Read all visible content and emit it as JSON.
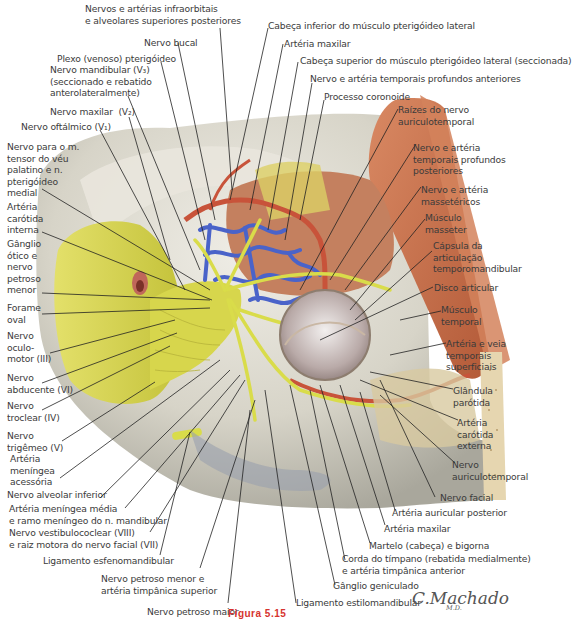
{
  "figure": {
    "figure_label": "Figura 5.15",
    "signature": "C.Machado",
    "signature_sub": "M.D."
  },
  "labels": {
    "top": [
      {
        "id": "infraorbitais",
        "text": "Nervos e artérias infraorbitais\ne alveolares superiores posteriores"
      },
      {
        "id": "bucal",
        "text": "Nervo bucal"
      },
      {
        "id": "plexo",
        "text": "Plexo (venoso) pterigóideo"
      },
      {
        "id": "mandibular",
        "text": "Nervo mandibular (V₃)\n(seccionado e rebatido\nanterolateralmente)"
      },
      {
        "id": "maxilar-n",
        "text": "Nervo maxilar  (V₂)"
      },
      {
        "id": "oftalmico",
        "text": "Nervo oftálmico (V₁)"
      },
      {
        "id": "cab-inf",
        "text": "Cabeça inferior do músculo pterigóideo lateral"
      },
      {
        "id": "art-maxilar-top",
        "text": "Artéria maxilar"
      },
      {
        "id": "cab-sup",
        "text": "Cabeça superior do músculo pterigóideo lateral (seccionada)"
      },
      {
        "id": "temp-ant",
        "text": "Nervo e artéria temporais profundos anteriores"
      },
      {
        "id": "coronoide",
        "text": "Processo coronoide"
      }
    ],
    "left": [
      {
        "id": "tensor",
        "text": "Nervo para o m.\ntensor do véu\npalatino e n.\npterigóideo\nmedial"
      },
      {
        "id": "carotida-int",
        "text": "Artéria\ncarótida\ninterna"
      },
      {
        "id": "ganglio-otico",
        "text": "Gânglio\nótico e\nnervo\npetroso\nmenor"
      },
      {
        "id": "forame-oval",
        "text": "Forame\noval"
      },
      {
        "id": "oculomotor",
        "text": "Nervo\noculo-\nmotor (III)"
      },
      {
        "id": "abducente",
        "text": "Nervo\nabducente (VI)"
      },
      {
        "id": "troclear",
        "text": "Nervo\ntroclear (IV)"
      },
      {
        "id": "trigemeo",
        "text": "Nervo\ntrigêmeo (V)"
      },
      {
        "id": "meningea-acess",
        "text": "Artéria\nmeníngea\nacessória"
      },
      {
        "id": "alveolar-inf",
        "text": "Nervo alveolar inferior"
      }
    ],
    "bottom": [
      {
        "id": "meningea-media",
        "text": "Artéria meníngea média\ne ramo meníngeo do n. mandibular"
      },
      {
        "id": "vestibulococlear",
        "text": "Nervo vestibulococlear (VIII)\ne raiz motora do nervo facial (VII)"
      },
      {
        "id": "esfenomandibular",
        "text": "Ligamento esfenomandibular"
      },
      {
        "id": "petroso-menor",
        "text": "Nervo petroso menor e\nartéria timpânica superior"
      },
      {
        "id": "petroso-maior",
        "text": "Nervo petroso maior"
      },
      {
        "id": "estilomandibular",
        "text": "Ligamento estilomandibular"
      },
      {
        "id": "geniculado",
        "text": "Gânglio geniculado"
      },
      {
        "id": "corda",
        "text": "Corda do tímpano (rebatida medialmente)\ne artéria timpânica anterior"
      },
      {
        "id": "martelo",
        "text": "Martelo (cabeça) e bigorna"
      },
      {
        "id": "art-maxilar-bot",
        "text": "Artéria maxilar"
      },
      {
        "id": "auricular-post",
        "text": "Artéria auricular posterior"
      },
      {
        "id": "facial",
        "text": "Nervo facial"
      }
    ],
    "right": [
      {
        "id": "raizes",
        "text": "Raízes do nervo\nauriculotemporal"
      },
      {
        "id": "temp-post",
        "text": "Nervo e artéria\ntemporais profundos\nposteriores"
      },
      {
        "id": "massetericos",
        "text": "Nervo e artéria\nmassetéricos"
      },
      {
        "id": "masseter",
        "text": "Músculo\nmasseter"
      },
      {
        "id": "capsula",
        "text": "Cápsula da\narticulação\ntemporomandibular"
      },
      {
        "id": "disco",
        "text": "Disco articular"
      },
      {
        "id": "temporal",
        "text": "Músculo\ntemporal"
      },
      {
        "id": "temp-superf",
        "text": "Artéria e veia\ntemporais\nsuperficiais"
      },
      {
        "id": "parotida",
        "text": "Glândula\nparótida"
      },
      {
        "id": "carotida-ext",
        "text": "Artéria\ncarótida\nexterna"
      },
      {
        "id": "auriculotemporal",
        "text": "Nervo\nauriculotemporal"
      }
    ]
  },
  "colors": {
    "nerve": "#d9dc4a",
    "artery": "#c8533a",
    "vein": "#4a63c9",
    "muscle": "#c9714e",
    "bone": "#d9d7cc",
    "label_text": "#3b3b3b",
    "figure_label": "#d6332e"
  }
}
